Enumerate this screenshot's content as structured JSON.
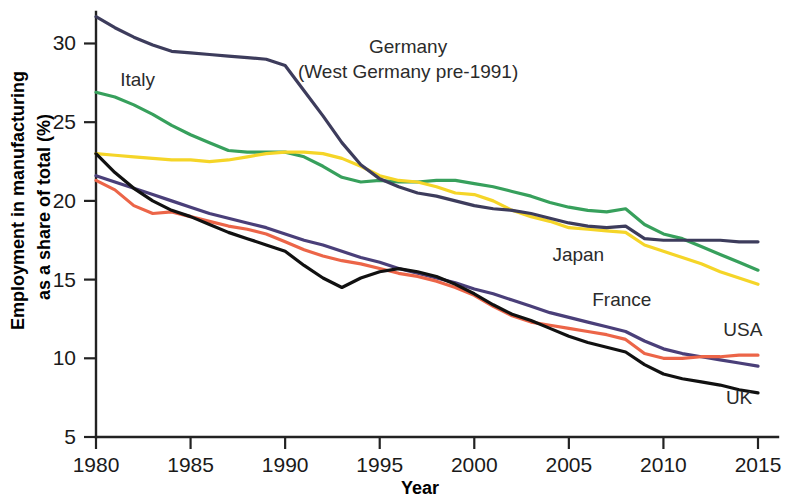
{
  "chart_data": {
    "type": "line",
    "title": "",
    "xlabel": "Year",
    "ylabel": "Employment in manufacturing as a share of total (%)",
    "ylabel_line1": "Employment in manufacturing",
    "ylabel_line2": "as a share of total (%)",
    "xlim": [
      1980,
      2015
    ],
    "ylim": [
      5,
      32
    ],
    "xticks": [
      1980,
      1985,
      1990,
      1995,
      2000,
      2005,
      2010,
      2015
    ],
    "xtick_labels": [
      "1980",
      "1985",
      "1990",
      "1995",
      "2000",
      "2005",
      "2010",
      "2015"
    ],
    "yticks": [
      5,
      10,
      15,
      20,
      25,
      30
    ],
    "ytick_labels": [
      "5",
      "10",
      "15",
      "20",
      "25",
      "30"
    ],
    "grid": false,
    "legend_position": "inline-annotations",
    "x": [
      1980,
      1981,
      1982,
      1983,
      1984,
      1985,
      1986,
      1987,
      1988,
      1989,
      1990,
      1991,
      1992,
      1993,
      1994,
      1995,
      1996,
      1997,
      1998,
      1999,
      2000,
      2001,
      2002,
      2003,
      2004,
      2005,
      2006,
      2007,
      2008,
      2009,
      2010,
      2011,
      2012,
      2013,
      2014,
      2015
    ],
    "series": [
      {
        "name": "Germany",
        "label": "Germany",
        "label_sub": "(West Germany pre-1991)",
        "color": "#3d3c5c",
        "values": [
          31.7,
          31.0,
          30.4,
          29.9,
          29.5,
          29.4,
          29.3,
          29.2,
          29.1,
          29.0,
          28.6,
          27.0,
          25.4,
          23.7,
          22.3,
          21.4,
          20.9,
          20.5,
          20.3,
          20.0,
          19.7,
          19.5,
          19.4,
          19.2,
          18.9,
          18.6,
          18.4,
          18.3,
          18.4,
          17.6,
          17.5,
          17.5,
          17.5,
          17.5,
          17.4,
          17.4
        ]
      },
      {
        "name": "Italy",
        "label": "Italy",
        "color": "#37a05c",
        "values": [
          26.9,
          26.6,
          26.1,
          25.5,
          24.8,
          24.2,
          23.7,
          23.2,
          23.1,
          23.1,
          23.1,
          22.8,
          22.2,
          21.5,
          21.2,
          21.3,
          21.2,
          21.2,
          21.3,
          21.3,
          21.1,
          20.9,
          20.6,
          20.3,
          19.9,
          19.6,
          19.4,
          19.3,
          19.5,
          18.5,
          17.9,
          17.6,
          17.1,
          16.6,
          16.1,
          15.6
        ]
      },
      {
        "name": "Japan",
        "label": "Japan",
        "color": "#f5d528",
        "values": [
          23.0,
          22.9,
          22.8,
          22.7,
          22.6,
          22.6,
          22.5,
          22.6,
          22.8,
          23.0,
          23.1,
          23.1,
          23.0,
          22.7,
          22.2,
          21.6,
          21.3,
          21.2,
          20.9,
          20.5,
          20.4,
          20.0,
          19.4,
          19.0,
          18.7,
          18.3,
          18.2,
          18.1,
          18.0,
          17.2,
          16.8,
          16.4,
          16.0,
          15.5,
          15.1,
          14.7
        ]
      },
      {
        "name": "France",
        "label": "France",
        "color": "#4a3f79",
        "values": [
          21.6,
          21.2,
          20.8,
          20.4,
          20.0,
          19.6,
          19.2,
          18.9,
          18.6,
          18.3,
          17.9,
          17.5,
          17.2,
          16.8,
          16.4,
          16.1,
          15.7,
          15.4,
          15.1,
          14.8,
          14.4,
          14.1,
          13.7,
          13.3,
          12.9,
          12.6,
          12.3,
          12.0,
          11.7,
          11.1,
          10.6,
          10.3,
          10.1,
          9.9,
          9.7,
          9.5
        ]
      },
      {
        "name": "USA",
        "label": "USA",
        "color": "#ec6548",
        "values": [
          21.3,
          20.7,
          19.7,
          19.2,
          19.3,
          19.0,
          18.7,
          18.4,
          18.2,
          17.9,
          17.4,
          16.9,
          16.5,
          16.2,
          16.0,
          15.7,
          15.4,
          15.2,
          14.9,
          14.5,
          14.0,
          13.3,
          12.7,
          12.3,
          12.1,
          11.9,
          11.7,
          11.5,
          11.2,
          10.3,
          10.0,
          10.0,
          10.1,
          10.1,
          10.2,
          10.2
        ]
      },
      {
        "name": "UK",
        "label": "UK",
        "color": "#111111",
        "values": [
          23.0,
          21.8,
          20.8,
          20.0,
          19.4,
          19.0,
          18.5,
          18.0,
          17.6,
          17.2,
          16.8,
          15.9,
          15.1,
          14.5,
          15.1,
          15.5,
          15.7,
          15.5,
          15.2,
          14.7,
          14.1,
          13.4,
          12.8,
          12.4,
          11.9,
          11.4,
          11.0,
          10.7,
          10.4,
          9.6,
          9.0,
          8.7,
          8.5,
          8.3,
          8.0,
          7.8
        ]
      }
    ],
    "annotations": [
      {
        "text": "Germany",
        "x": 1996.5,
        "y": 29.4
      },
      {
        "text": "(West Germany pre-1991)",
        "x": 1996.5,
        "y": 27.8
      },
      {
        "text": "Italy",
        "x": 1982.2,
        "y": 27.3
      },
      {
        "text": "Japan",
        "x": 2005.5,
        "y": 16.2
      },
      {
        "text": "France",
        "x": 2007.8,
        "y": 13.3
      },
      {
        "text": "USA",
        "x": 2014.2,
        "y": 11.4
      },
      {
        "text": "UK",
        "x": 2014.0,
        "y": 7.1
      }
    ]
  }
}
